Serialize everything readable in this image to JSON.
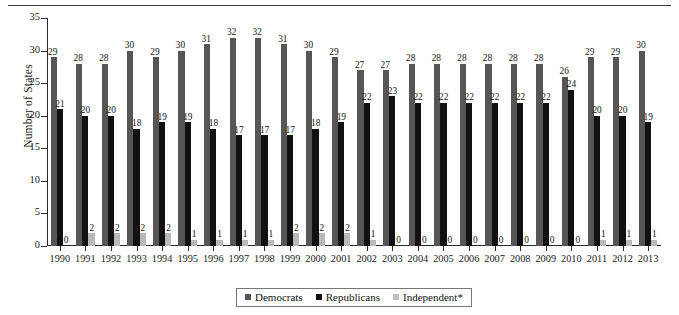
{
  "chart_data": {
    "type": "bar",
    "title": "",
    "xlabel": "",
    "ylabel": "Number of States",
    "ylim": [
      0,
      35
    ],
    "yticks": [
      0,
      5,
      10,
      15,
      20,
      25,
      30,
      35
    ],
    "grid": false,
    "legend_position": "bottom",
    "categories": [
      "1990",
      "1991",
      "1992",
      "1993",
      "1994",
      "1995",
      "1996",
      "1997",
      "1998",
      "1999",
      "2000",
      "2001",
      "2002",
      "2003",
      "2004",
      "2005",
      "2006",
      "2007",
      "2008",
      "2009",
      "2010",
      "2011",
      "2012",
      "2013"
    ],
    "series": [
      {
        "name": "Democrats",
        "color": "#565656",
        "values": [
          29,
          28,
          28,
          30,
          29,
          30,
          31,
          32,
          32,
          31,
          30,
          29,
          27,
          27,
          28,
          28,
          28,
          28,
          28,
          28,
          26,
          29,
          29,
          30
        ]
      },
      {
        "name": "Republicans",
        "color": "#111111",
        "values": [
          21,
          20,
          20,
          18,
          19,
          19,
          18,
          17,
          17,
          17,
          18,
          19,
          22,
          23,
          22,
          22,
          22,
          22,
          22,
          22,
          24,
          20,
          20,
          19
        ]
      },
      {
        "name": "Independent*",
        "color": "#bfbfbf",
        "values": [
          0,
          2,
          2,
          2,
          2,
          1,
          1,
          1,
          1,
          2,
          2,
          2,
          1,
          0,
          0,
          0,
          0,
          0,
          0,
          0,
          0,
          1,
          1,
          1
        ]
      }
    ]
  },
  "legend": {
    "items": [
      {
        "label": "Democrats"
      },
      {
        "label": "Republicans"
      },
      {
        "label": "Independent*"
      }
    ]
  }
}
